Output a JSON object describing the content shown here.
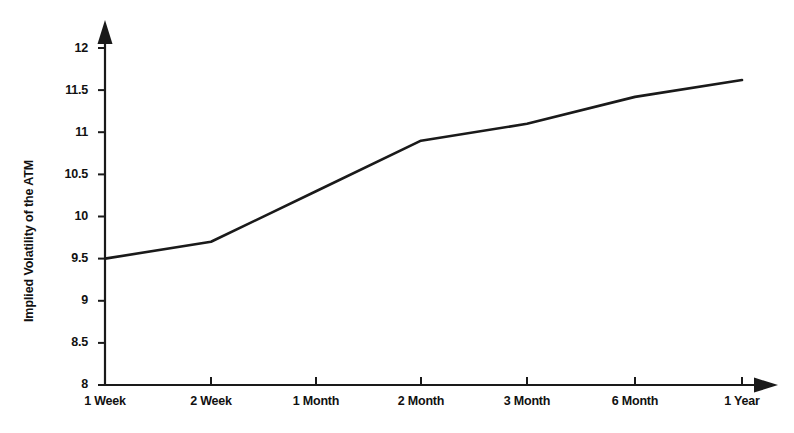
{
  "chart_data": {
    "type": "line",
    "title": "",
    "subtitle": "",
    "xlabel": "",
    "ylabel": "Implied Volatility of the ATM",
    "categories": [
      "1 Week",
      "2 Week",
      "1 Month",
      "2 Month",
      "3 Month",
      "6 Month",
      "1 Year"
    ],
    "values": [
      9.5,
      9.7,
      10.3,
      10.9,
      11.1,
      11.42,
      11.62
    ],
    "series": [
      {
        "name": "Implied Volatility of the ATM",
        "values": [
          9.5,
          9.7,
          10.3,
          10.9,
          11.1,
          11.42,
          11.62
        ]
      }
    ],
    "ylim": [
      8,
      12
    ],
    "ytick_labels": [
      "12",
      "11.5",
      "11",
      "10.5",
      "10",
      "9.5",
      "9",
      "8.5",
      "8"
    ],
    "ytick_values": [
      12,
      11.5,
      11,
      10.5,
      10,
      9.5,
      9,
      8.5,
      8
    ],
    "xtick_labels": [
      "1 Week",
      "2 Week",
      "1 Month",
      "2 Month",
      "3 Month",
      "6 Month",
      "1 Year"
    ],
    "grid": false,
    "legend": false,
    "legend_position": "none",
    "line_color": "#1a1a1a",
    "axis_color": "#1a1a1a",
    "background_color": "#ffffff",
    "annotations": []
  },
  "axes": {
    "y_axis_title": "Implied Volatility of the ATM",
    "x_axis_title": "",
    "y_arrow": "arrow-up",
    "x_arrow": "arrow-right"
  }
}
